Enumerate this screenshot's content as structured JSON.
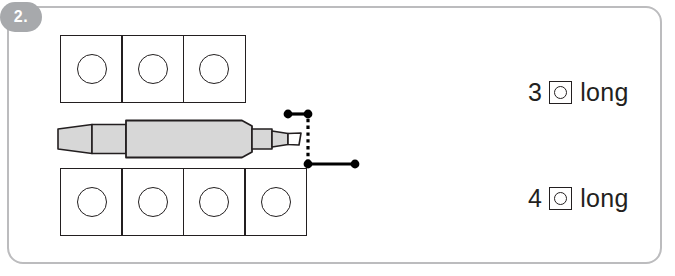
{
  "problem": {
    "number_label": "2.",
    "badge_color": "#a7a9ac"
  },
  "card": {
    "border_color": "#bcbcbe",
    "background_color": "#ffffff"
  },
  "measurement_object": {
    "name": "marker-pen",
    "body_fill": "#d7d7d7",
    "outline_color": "#231f20",
    "orientation": "horizontal"
  },
  "grids": {
    "top_row": {
      "name": "top-grid-row",
      "cell_count": 3,
      "cells": [
        {
          "shape": "circle"
        },
        {
          "shape": "circle"
        },
        {
          "shape": "circle"
        }
      ]
    },
    "bottom_row": {
      "name": "bottom-grid-row",
      "cell_count": 4,
      "cells": [
        {
          "shape": "circle"
        },
        {
          "shape": "circle"
        },
        {
          "shape": "circle"
        },
        {
          "shape": "circle"
        }
      ]
    }
  },
  "measure_marks": {
    "top": {
      "dot_count": 2,
      "color": "#000000"
    },
    "bottom": {
      "dot_count": 2,
      "color": "#000000"
    },
    "connector": {
      "style": "dotted",
      "color": "#000000"
    }
  },
  "answers": [
    {
      "name": "answer-label-top",
      "number": "3",
      "unit_icon": "square-with-circle-icon",
      "word": "long"
    },
    {
      "name": "answer-label-bottom",
      "number": "4",
      "unit_icon": "square-with-circle-icon",
      "word": "long"
    }
  ]
}
